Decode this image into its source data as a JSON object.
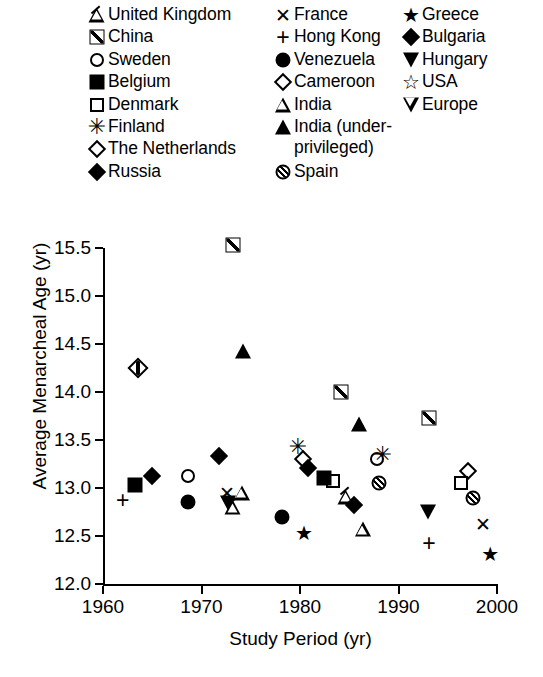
{
  "legend": {
    "columns": [
      [
        {
          "label": "United Kingdom",
          "marker": "tri-hatch"
        },
        {
          "label": "China",
          "marker": "square-hatch"
        },
        {
          "label": "Sweden",
          "marker": "circle-open"
        },
        {
          "label": "Belgium",
          "marker": "square-fill"
        },
        {
          "label": "Denmark",
          "marker": "square-open"
        },
        {
          "label": "Finland",
          "marker": "asterisk"
        },
        {
          "label": "The Netherlands",
          "marker": "diamond-open"
        },
        {
          "label": "Russia",
          "marker": "diamond-fill"
        }
      ],
      [
        {
          "label": "France",
          "marker": "x"
        },
        {
          "label": "Hong Kong",
          "marker": "plus"
        },
        {
          "label": "Venezuela",
          "marker": "circle-fill"
        },
        {
          "label": "Cameroon",
          "marker": "diamond-open"
        },
        {
          "label": "India",
          "marker": "tri-open"
        },
        {
          "label": "India (under-\nprivileged)",
          "marker": "tri-fill",
          "tall": true
        },
        {
          "label": "Spain",
          "marker": "circle-slash"
        }
      ],
      [
        {
          "label": "Greece",
          "marker": "star-fill"
        },
        {
          "label": "Bulgaria",
          "marker": "diamond-fill"
        },
        {
          "label": "Hungary",
          "marker": "tridown-fill"
        },
        {
          "label": "USA",
          "marker": "star-open"
        },
        {
          "label": "Europe",
          "marker": "tridown-open"
        }
      ]
    ]
  },
  "chart_data": {
    "type": "scatter",
    "title": "",
    "xlabel": "Study Period (yr)",
    "ylabel": "Average Menarcheal Age (yr)",
    "xlim": [
      1960,
      2000
    ],
    "ylim": [
      12.0,
      15.5
    ],
    "xticks": [
      1960,
      1970,
      1980,
      1990,
      2000
    ],
    "yticks": [
      "12.0",
      "12.5",
      "13.0",
      "13.5",
      "14.0",
      "14.5",
      "15.0",
      "15.5"
    ],
    "grid": false,
    "legend_position": "above-plot",
    "points": [
      {
        "country": "Hong Kong",
        "marker": "plus",
        "x": 1962.0,
        "y": 12.88
      },
      {
        "country": "Belgium",
        "marker": "square-fill",
        "x": 1963.2,
        "y": 13.03
      },
      {
        "country": "The Netherlands",
        "marker": "diamond-hatch",
        "x": 1963.6,
        "y": 14.25
      },
      {
        "country": "Russia",
        "marker": "diamond-fill",
        "x": 1965.0,
        "y": 13.13
      },
      {
        "country": "Sweden",
        "marker": "circle-open",
        "x": 1968.6,
        "y": 13.12
      },
      {
        "country": "Venezuela",
        "marker": "circle-fill",
        "x": 1968.6,
        "y": 12.85
      },
      {
        "country": "Russia",
        "marker": "diamond-fill",
        "x": 1971.8,
        "y": 13.33
      },
      {
        "country": "France",
        "marker": "x",
        "x": 1972.6,
        "y": 12.95
      },
      {
        "country": "Hungary",
        "marker": "tridown-fill",
        "x": 1972.7,
        "y": 12.84
      },
      {
        "country": "China",
        "marker": "square-hatch",
        "x": 1973.2,
        "y": 15.53
      },
      {
        "country": "United Kingdom",
        "marker": "tri-hatch",
        "x": 1973.2,
        "y": 12.8
      },
      {
        "country": "India",
        "marker": "tri-open",
        "x": 1974.1,
        "y": 12.95
      },
      {
        "country": "India (underprivileged)",
        "marker": "tri-fill",
        "x": 1974.2,
        "y": 14.43
      },
      {
        "country": "Venezuela",
        "marker": "circle-fill",
        "x": 1978.2,
        "y": 12.7
      },
      {
        "country": "Finland",
        "marker": "asterisk",
        "x": 1979.8,
        "y": 13.43
      },
      {
        "country": "Cameroon",
        "marker": "diamond-open",
        "x": 1980.3,
        "y": 13.3
      },
      {
        "country": "Greece",
        "marker": "star-fill",
        "x": 1980.4,
        "y": 12.53
      },
      {
        "country": "Russia",
        "marker": "diamond-fill",
        "x": 1980.8,
        "y": 13.21
      },
      {
        "country": "Belgium",
        "marker": "square-fill",
        "x": 1982.4,
        "y": 13.1
      },
      {
        "country": "Denmark",
        "marker": "square-open",
        "x": 1983.3,
        "y": 13.07
      },
      {
        "country": "China",
        "marker": "square-hatch",
        "x": 1984.2,
        "y": 14.0
      },
      {
        "country": "United Kingdom",
        "marker": "tri-hatch",
        "x": 1984.7,
        "y": 12.91
      },
      {
        "country": "Bulgaria",
        "marker": "diamond-fill",
        "x": 1985.5,
        "y": 12.82
      },
      {
        "country": "India (underprivileged)",
        "marker": "tri-fill",
        "x": 1986.0,
        "y": 13.67
      },
      {
        "country": "India",
        "marker": "tri-open",
        "x": 1986.4,
        "y": 12.57
      },
      {
        "country": "Sweden",
        "marker": "circle-open",
        "x": 1987.8,
        "y": 13.3
      },
      {
        "country": "Finland",
        "marker": "asterisk",
        "x": 1988.4,
        "y": 13.34
      },
      {
        "country": "Spain",
        "marker": "circle-slash",
        "x": 1988.0,
        "y": 13.05
      },
      {
        "country": "China",
        "marker": "square-hatch",
        "x": 1993.1,
        "y": 13.73
      },
      {
        "country": "Hungary",
        "marker": "tridown-fill",
        "x": 1993.0,
        "y": 12.75
      },
      {
        "country": "Hong Kong",
        "marker": "plus",
        "x": 1993.1,
        "y": 12.43
      },
      {
        "country": "Cameroon",
        "marker": "diamond-open",
        "x": 1997.1,
        "y": 13.18
      },
      {
        "country": "Denmark",
        "marker": "square-open",
        "x": 1996.3,
        "y": 13.05
      },
      {
        "country": "Spain",
        "marker": "circle-slash",
        "x": 1997.6,
        "y": 12.9
      },
      {
        "country": "France",
        "marker": "x",
        "x": 1998.6,
        "y": 12.62
      },
      {
        "country": "Greece",
        "marker": "star-fill",
        "x": 1999.3,
        "y": 12.31
      }
    ]
  }
}
